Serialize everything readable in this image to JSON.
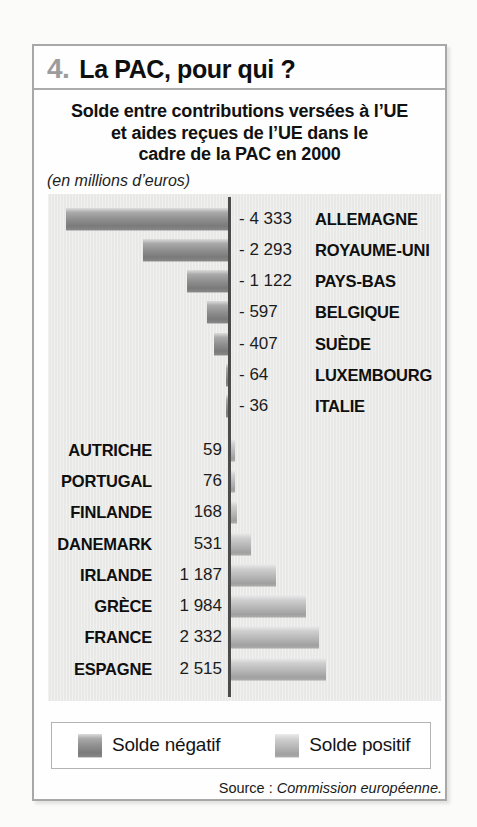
{
  "header": {
    "number": "4.",
    "heading": "La PAC, pour qui ?"
  },
  "title": {
    "lines": [
      "Solde entre contributions versées à l’UE",
      "et aides reçues de l’UE dans le",
      "cadre de la PAC en 2000"
    ],
    "unit_note": "(en millions d’euros)"
  },
  "chart_data": {
    "type": "bar",
    "orientation": "horizontal-diverging",
    "title": "Solde entre contributions versées à l’UE et aides reçues de l’UE dans le cadre de la PAC en 2000",
    "unit": "millions d’euros",
    "value_range": [
      -4333,
      2515
    ],
    "zero_axis": true,
    "rows": [
      {
        "id": "allemagne",
        "country": "ALLEMAGNE",
        "value": -4333,
        "label": "- 4 333",
        "side": "negative"
      },
      {
        "id": "royaume-uni",
        "country": "ROYAUME-UNI",
        "value": -2293,
        "label": "- 2 293",
        "side": "negative"
      },
      {
        "id": "pays-bas",
        "country": "PAYS-BAS",
        "value": -1122,
        "label": "- 1 122",
        "side": "negative"
      },
      {
        "id": "belgique",
        "country": "BELGIQUE",
        "value": -597,
        "label": "- 597",
        "side": "negative"
      },
      {
        "id": "suede",
        "country": "SUÈDE",
        "value": -407,
        "label": "- 407",
        "side": "negative"
      },
      {
        "id": "luxembourg",
        "country": "LUXEMBOURG",
        "value": -64,
        "label": "- 64",
        "side": "negative"
      },
      {
        "id": "italie",
        "country": "ITALIE",
        "value": -36,
        "label": "- 36",
        "side": "negative"
      },
      {
        "id": "autriche",
        "country": "AUTRICHE",
        "value": 59,
        "label": "59",
        "side": "positive"
      },
      {
        "id": "portugal",
        "country": "PORTUGAL",
        "value": 76,
        "label": "76",
        "side": "positive"
      },
      {
        "id": "finlande",
        "country": "FINLANDE",
        "value": 168,
        "label": "168",
        "side": "positive"
      },
      {
        "id": "danemark",
        "country": "DANEMARK",
        "value": 531,
        "label": "531",
        "side": "positive"
      },
      {
        "id": "irlande",
        "country": "IRLANDE",
        "value": 1187,
        "label": "1 187",
        "side": "positive"
      },
      {
        "id": "grece",
        "country": "GRÈCE",
        "value": 1984,
        "label": "1 984",
        "side": "positive"
      },
      {
        "id": "france",
        "country": "FRANCE",
        "value": 2332,
        "label": "2 332",
        "side": "positive"
      },
      {
        "id": "espagne",
        "country": "ESPAGNE",
        "value": 2515,
        "label": "2 515",
        "side": "positive"
      }
    ],
    "colors": {
      "negative_bar": "#8d8d8d",
      "positive_bar": "#bcbcbc",
      "panel_bg": "#ecedeb",
      "axis": "#4b4b4b",
      "figure_number": "#9c9c9c"
    },
    "legend_position": "bottom"
  },
  "legend": {
    "items": [
      {
        "label": "Solde négatif",
        "type": "negative"
      },
      {
        "label": "Solde positif",
        "type": "positive"
      }
    ]
  },
  "source": {
    "prefix": "Source : ",
    "text": "Commission européenne."
  }
}
